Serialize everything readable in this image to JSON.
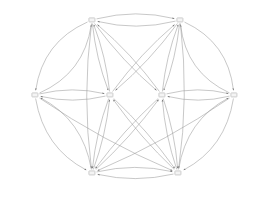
{
  "diagram": {
    "type": "directed-graph",
    "title": "",
    "canvas": {
      "width": 273,
      "height": 200
    },
    "style": {
      "background": "#ffffff",
      "edge_color": "#9a9a9a",
      "arrow_color": "#6f6f6f",
      "node_fill": "#f4f4f4",
      "node_border": "#cccccc",
      "node_text": "#1d1d1d"
    },
    "nodes": [
      {
        "id": "n1",
        "label": "(c≻d)≻(b≻a)",
        "x": 92,
        "y": 20,
        "row": "top"
      },
      {
        "id": "n2",
        "label": "(c≻d)≻(a≻b)",
        "x": 180,
        "y": 20,
        "row": "top"
      },
      {
        "id": "n3",
        "label": "(b≻a)≻(c≻d)",
        "x": 35,
        "y": 95,
        "row": "middle"
      },
      {
        "id": "n4",
        "label": "(a≻b)≻(c≻d)",
        "x": 110,
        "y": 95,
        "row": "middle"
      },
      {
        "id": "n5",
        "label": "(d≻c)≻(b≻a)",
        "x": 162,
        "y": 95,
        "row": "middle"
      },
      {
        "id": "n6",
        "label": "(d≻c)≻(a≻b)",
        "x": 234,
        "y": 95,
        "row": "middle"
      },
      {
        "id": "n7",
        "label": "(b≻a)≻(d≻c)",
        "x": 92,
        "y": 173,
        "row": "bottom"
      },
      {
        "id": "n8",
        "label": "(a≻b)≻(d≻c)",
        "x": 178,
        "y": 173,
        "row": "bottom"
      }
    ],
    "edges": [
      {
        "from": "n1",
        "to": "n2",
        "bend": -11
      },
      {
        "from": "n2",
        "to": "n1",
        "bend": -11
      },
      {
        "from": "n3",
        "to": "n4",
        "bend": -9
      },
      {
        "from": "n4",
        "to": "n3",
        "bend": -9
      },
      {
        "from": "n5",
        "to": "n6",
        "bend": -9
      },
      {
        "from": "n6",
        "to": "n5",
        "bend": -9
      },
      {
        "from": "n7",
        "to": "n8",
        "bend": -10
      },
      {
        "from": "n8",
        "to": "n7",
        "bend": -10
      },
      {
        "from": "n1",
        "to": "n3",
        "bend": 26
      },
      {
        "from": "n3",
        "to": "n1",
        "bend": 26
      },
      {
        "from": "n2",
        "to": "n6",
        "bend": -26
      },
      {
        "from": "n6",
        "to": "n2",
        "bend": -26
      },
      {
        "from": "n3",
        "to": "n7",
        "bend": 24
      },
      {
        "from": "n7",
        "to": "n3",
        "bend": 24
      },
      {
        "from": "n6",
        "to": "n8",
        "bend": -24
      },
      {
        "from": "n8",
        "to": "n6",
        "bend": -24
      },
      {
        "from": "n1",
        "to": "n4",
        "bend": 5
      },
      {
        "from": "n4",
        "to": "n1",
        "bend": 5
      },
      {
        "from": "n1",
        "to": "n5",
        "bend": 6
      },
      {
        "from": "n5",
        "to": "n1",
        "bend": 6
      },
      {
        "from": "n2",
        "to": "n4",
        "bend": -6
      },
      {
        "from": "n4",
        "to": "n2",
        "bend": -6
      },
      {
        "from": "n2",
        "to": "n5",
        "bend": -5
      },
      {
        "from": "n5",
        "to": "n2",
        "bend": -5
      },
      {
        "from": "n1",
        "to": "n7",
        "bend": 10
      },
      {
        "from": "n2",
        "to": "n8",
        "bend": -10
      },
      {
        "from": "n4",
        "to": "n7",
        "bend": 5
      },
      {
        "from": "n7",
        "to": "n4",
        "bend": 5
      },
      {
        "from": "n4",
        "to": "n8",
        "bend": -5
      },
      {
        "from": "n8",
        "to": "n4",
        "bend": -5
      },
      {
        "from": "n5",
        "to": "n7",
        "bend": 5
      },
      {
        "from": "n7",
        "to": "n5",
        "bend": 5
      },
      {
        "from": "n5",
        "to": "n8",
        "bend": -5
      },
      {
        "from": "n8",
        "to": "n5",
        "bend": -5
      },
      {
        "from": "n3",
        "to": "n8",
        "bend": 8
      },
      {
        "from": "n6",
        "to": "n7",
        "bend": -8
      }
    ]
  }
}
